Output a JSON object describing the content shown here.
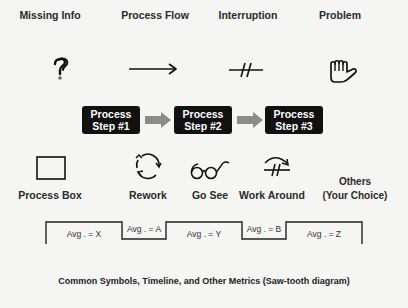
{
  "symbols_top": [
    {
      "label": "Missing Info",
      "icon": "question-mark-icon"
    },
    {
      "label": "Process Flow",
      "icon": "arrow-right-icon"
    },
    {
      "label": "Interruption",
      "icon": "interruption-icon"
    },
    {
      "label": "Problem",
      "icon": "hand-stop-icon"
    }
  ],
  "process_steps": [
    {
      "line1": "Process",
      "line2": "Step #1"
    },
    {
      "line1": "Process",
      "line2": "Step #2"
    },
    {
      "line1": "Process",
      "line2": "Step #3"
    }
  ],
  "symbols_bottom": [
    {
      "label": "Process Box",
      "icon": "square-box-icon"
    },
    {
      "label": "Rework",
      "icon": "circular-arrows-icon"
    },
    {
      "label": "Go See",
      "icon": "eyeglasses-icon"
    },
    {
      "label": "Work Around",
      "icon": "work-around-icon"
    },
    {
      "label_line1": "Others",
      "label_line2": "(Your Choice)"
    }
  ],
  "sawtooth": {
    "segments": [
      {
        "label": "Avg . = X",
        "level": "high"
      },
      {
        "label": "Avg . = A",
        "level": "low"
      },
      {
        "label": "Avg . = Y",
        "level": "high"
      },
      {
        "label": "Avg . = B",
        "level": "low"
      },
      {
        "label": "Avg . = Z",
        "level": "high"
      }
    ]
  },
  "caption": "Common Symbols, Timeline, and Other Metrics (Saw-tooth diagram)",
  "colors": {
    "background": "#f5f5f4",
    "step_box": "#111111",
    "step_arrow": "#8c8c8c",
    "text": "#222222"
  }
}
